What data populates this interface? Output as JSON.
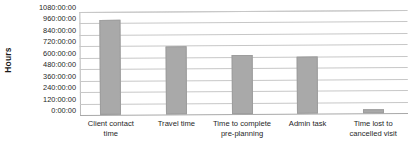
{
  "chart_data": {
    "type": "bar",
    "title": "",
    "xlabel": "",
    "ylabel": "Hours",
    "categories": [
      "Client contact time",
      "Travel time",
      "Time to complete pre-planning",
      "Admin task",
      "Time lost to cancelled visit"
    ],
    "values": [
      1000,
      710,
      620,
      595,
      45
    ],
    "value_labels": [
      "1000:00:00",
      "710:00:00",
      "620:00:00",
      "595:00:00",
      "45:00:00"
    ],
    "series": [
      {
        "name": "Hours",
        "values": [
          1000,
          710,
          620,
          595,
          45
        ]
      }
    ],
    "ylim": [
      0,
      1080
    ],
    "ytick_values": [
      0,
      120,
      240,
      360,
      480,
      600,
      720,
      840,
      960,
      1080
    ],
    "ytick_labels": [
      "0:00:00",
      "120:00:00",
      "240:00:00",
      "360:00:00",
      "480:00:00",
      "600:00:00",
      "720:00:00",
      "840:00:00",
      "960:00:00",
      "1080:00:00"
    ],
    "grid": true,
    "grid_axis": "y",
    "legend": false,
    "legend_position": "none",
    "bar_color": "#a9a9a9",
    "grid_color": "#c7c7c7",
    "axis_color": "#b9b9b9",
    "background_color": "#ffffff",
    "text_color": "#1f1f1f"
  }
}
